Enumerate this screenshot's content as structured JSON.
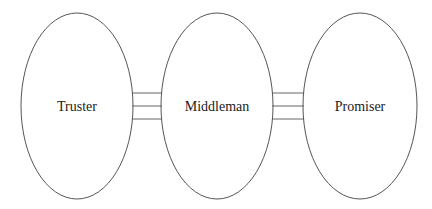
{
  "diagram": {
    "nodes": [
      {
        "id": "truster",
        "label": "Truster",
        "cx": 77,
        "cy": 106,
        "rx": 56,
        "ry": 93
      },
      {
        "id": "middleman",
        "label": "Middleman",
        "cx": 217,
        "cy": 106,
        "rx": 56,
        "ry": 93
      },
      {
        "id": "promiser",
        "label": "Promiser",
        "cx": 360,
        "cy": 106,
        "rx": 57,
        "ry": 93
      }
    ],
    "edges": [
      {
        "from": "truster",
        "to": "middleman",
        "x1": 132,
        "x2": 162,
        "lines_y": [
          93,
          106,
          119
        ]
      },
      {
        "from": "middleman",
        "to": "promiser",
        "x1": 272,
        "x2": 304,
        "lines_y": [
          93,
          106,
          119
        ]
      }
    ]
  }
}
